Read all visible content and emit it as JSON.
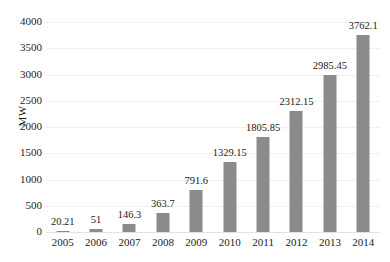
{
  "chart_data": {
    "type": "bar",
    "title": "",
    "xlabel": "",
    "ylabel": "MW",
    "categories": [
      "2005",
      "2006",
      "2007",
      "2008",
      "2009",
      "2010",
      "2011",
      "2012",
      "2013",
      "2014"
    ],
    "values": [
      20.21,
      51,
      146.3,
      363.7,
      791.6,
      1329.15,
      1805.85,
      2312.15,
      2985.45,
      3762.1
    ],
    "value_labels": [
      "20.21",
      "51",
      "146.3",
      "363.7",
      "791.6",
      "1329.15",
      "1805.85",
      "2312.15",
      "2985.45",
      "3762.1"
    ],
    "ylim": [
      0,
      4000
    ],
    "yticks": [
      0,
      500,
      1000,
      1500,
      2000,
      2500,
      3000,
      3500,
      4000
    ],
    "ytick_labels": [
      "0",
      "500",
      "1000",
      "1500",
      "2000",
      "2500",
      "3000",
      "3500",
      "4000"
    ],
    "grid": true,
    "grid_axis": "y",
    "legend": null,
    "bar_color": "#8b8b8b",
    "text_color": "#1c1c1c",
    "grid_color": "#efefef",
    "background": "#ffffff"
  }
}
